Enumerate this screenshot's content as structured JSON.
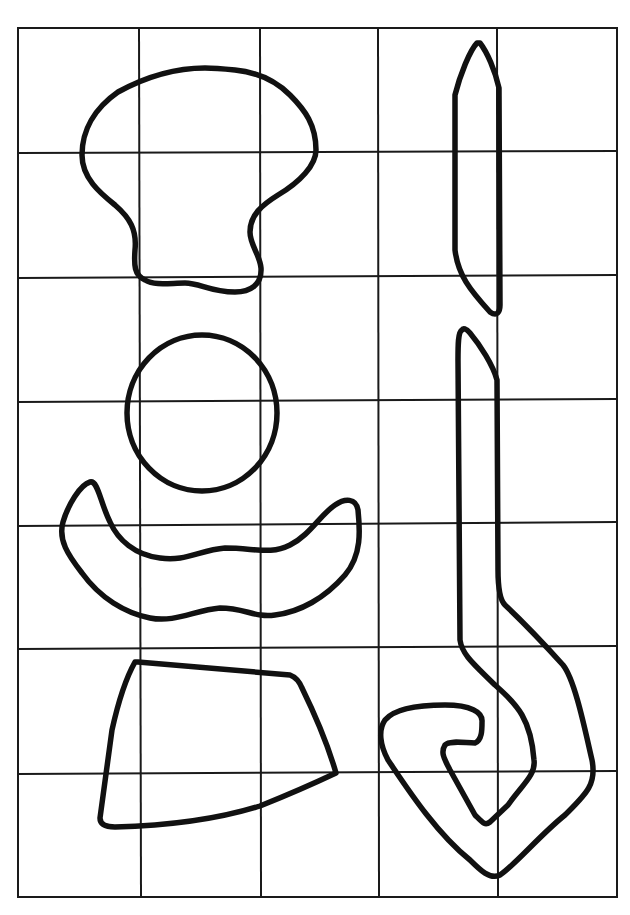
{
  "figure": {
    "grid": {
      "columns": 5,
      "rows": 7,
      "x_lines": [
        18,
        139,
        260,
        378,
        498,
        617
      ],
      "y_lines": [
        28,
        153,
        277,
        401,
        524,
        648,
        772,
        897
      ],
      "line_color": "#1a1a1a"
    },
    "stroke_color": "#111111",
    "shapes": [
      {
        "name": "mushroom-shape"
      },
      {
        "name": "circle-shape"
      },
      {
        "name": "crescent-shape"
      },
      {
        "name": "trapezoid-shape"
      },
      {
        "name": "blade-shape"
      },
      {
        "name": "hook-shape"
      }
    ]
  }
}
